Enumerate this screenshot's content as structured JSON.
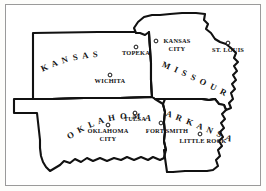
{
  "map": {
    "title": "Map of Kansas, Missouri, Oklahoma and Arkansas",
    "style": "hand-drawn line map, black ink on white",
    "frame": {
      "visible": true,
      "color": "#9a9a9a"
    },
    "ink_color": "#111111",
    "background_color": "#ffffff",
    "states": [
      {
        "name": "KANSAS",
        "label": "K A N S A S",
        "label_style": "arched-up"
      },
      {
        "name": "MISSOURI",
        "label": "M I S S O U R I",
        "label_style": "arched-diagonal"
      },
      {
        "name": "OKLAHOMA",
        "label": "O K L A H O M A",
        "label_style": "arched-up"
      },
      {
        "name": "ARKANSAS",
        "label": "A R K A N S A S",
        "label_style": "arched-diagonal"
      }
    ],
    "cities": [
      {
        "name": "TOPEKA",
        "lines": [
          "TOPEKA"
        ],
        "state": "KANSAS",
        "marker": "circle"
      },
      {
        "name": "WICHITA",
        "lines": [
          "WICHITA"
        ],
        "state": "KANSAS",
        "marker": "circle"
      },
      {
        "name": "KANSAS CITY",
        "lines": [
          "KANSAS",
          "CITY"
        ],
        "state": "MISSOURI",
        "marker": "circle"
      },
      {
        "name": "ST. LOUIS",
        "lines": [
          "ST. LOUIS"
        ],
        "state": "MISSOURI",
        "marker": "circle"
      },
      {
        "name": "TULSA",
        "lines": [
          "TULSA"
        ],
        "state": "OKLAHOMA",
        "marker": "circle"
      },
      {
        "name": "OKLAHOMA CITY",
        "lines": [
          "OKLAHOMA",
          "CITY"
        ],
        "state": "OKLAHOMA",
        "marker": "circle"
      },
      {
        "name": "FORT SMITH",
        "lines": [
          "FORT SMITH"
        ],
        "state": "ARKANSAS",
        "marker": "circle"
      },
      {
        "name": "LITTLE ROCK",
        "lines": [
          "LITTLE ROCK"
        ],
        "state": "ARKANSAS",
        "marker": "circle"
      }
    ],
    "labels": {
      "kansas": "K A N S A S",
      "missouri": "M I S S O U R I",
      "oklahoma": "O K L A H O M A",
      "arkansas": "A R K A N S A S",
      "topeka": "TOPEKA",
      "wichita": "WICHITA",
      "kansas_city_1": "KANSAS",
      "kansas_city_2": "CITY",
      "st_louis": "ST. LOUIS",
      "tulsa": "TULSA",
      "oklahoma_city_1": "OKLAHOMA",
      "oklahoma_city_2": "CITY",
      "fort_smith": "FORT SMITH",
      "little_rock": "LITTLE ROCK"
    }
  }
}
